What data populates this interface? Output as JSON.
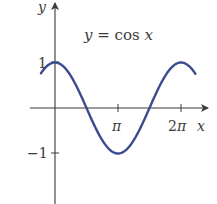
{
  "chart_data": {
    "type": "line",
    "title": "y = cos x",
    "xlabel": "x",
    "ylabel": "y",
    "x_ticks": [
      {
        "value": 3.14159,
        "label": "π"
      },
      {
        "value": 6.28319,
        "label": "2π"
      }
    ],
    "y_ticks": [
      {
        "value": 1,
        "label": "1"
      },
      {
        "value": -1,
        "label": "-1"
      }
    ],
    "xlim": [
      -0.8,
      7.3
    ],
    "ylim": [
      -2.1,
      2.35
    ],
    "grid": false,
    "legend": "none",
    "series": [
      {
        "name": "y = cos x",
        "color": "#3b4b8e",
        "x_range": [
          -0.7,
          7.0
        ],
        "function": "cos"
      }
    ]
  },
  "labels": {
    "title": "y = cos x",
    "x_axis": "x",
    "y_axis": "y",
    "tick_pi": "π",
    "tick_2pi": "2π",
    "tick_1": "1",
    "tick_neg1": "−1"
  }
}
